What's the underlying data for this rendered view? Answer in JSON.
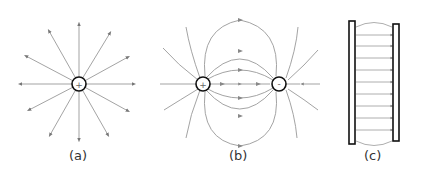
{
  "panels": [
    {
      "id": "a",
      "caption": "(a)",
      "description": "Single positive point charge with radial field lines pointing outward",
      "charge": "+"
    },
    {
      "id": "b",
      "caption": "(b)",
      "description": "Electric dipole: positive and negative charges with field lines from + to -",
      "charges": [
        "+",
        "-"
      ]
    },
    {
      "id": "c",
      "caption": "(c)",
      "description": "Parallel plate capacitor with uniform field lines between plates",
      "left_plate": "+",
      "right_plate": "-"
    }
  ],
  "colors": {
    "field_line": "#8a8a8a",
    "charge_outline": "#111111",
    "arrow": "#707070"
  }
}
